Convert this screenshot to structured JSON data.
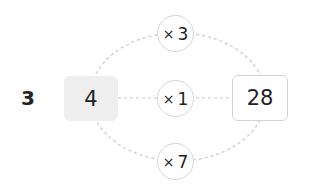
{
  "row_label": "3",
  "input_value": "4",
  "output_value": "28",
  "operators": [
    {
      "symbol": "×",
      "factor": "3"
    },
    {
      "symbol": "×",
      "factor": "1"
    },
    {
      "symbol": "×",
      "factor": "7"
    }
  ],
  "colors": {
    "input_fill": "#efefef",
    "output_border": "#d4d4d4",
    "circle_border": "#d6d6d6",
    "dashed_line": "#c8c8c8"
  }
}
